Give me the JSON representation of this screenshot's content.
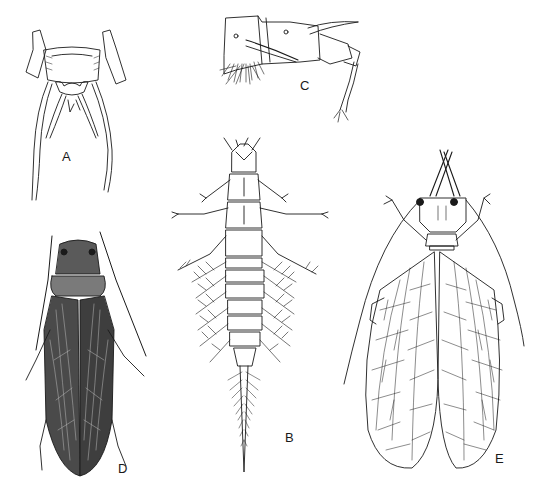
{
  "figure": {
    "panels": [
      {
        "id": "A",
        "label": "A",
        "subject": "abdomen-tip-dorsal-with-cerci",
        "label_pos": [
          62,
          150
        ]
      },
      {
        "id": "B",
        "label": "B",
        "subject": "aquatic-larva-with-lateral-gills-and-fringed-tail",
        "label_pos": [
          285,
          431
        ]
      },
      {
        "id": "C",
        "label": "C",
        "subject": "abdominal-segments-lateral-view-with-leg",
        "label_pos": [
          300,
          79
        ]
      },
      {
        "id": "D",
        "label": "D",
        "subject": "dark-shaded-adult-dorsal",
        "label_pos": [
          118,
          462
        ]
      },
      {
        "id": "E",
        "label": "E",
        "subject": "net-veined-adult-with-long-antennae",
        "label_pos": [
          495,
          452
        ]
      }
    ],
    "caption": "",
    "colors": {
      "background": "#ffffff",
      "ink": "#1a1a1a",
      "shade": "#4a4a4a"
    }
  }
}
